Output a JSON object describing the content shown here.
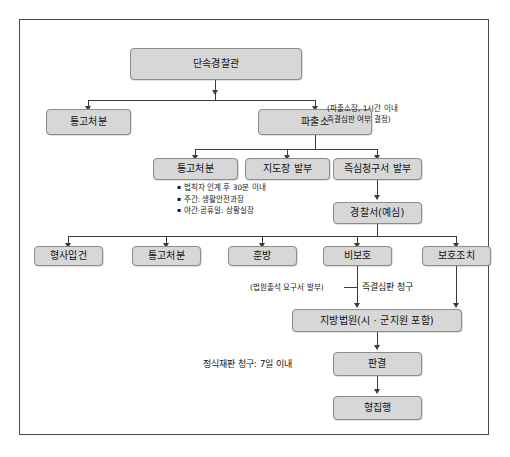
{
  "diagram": {
    "title_visible": false,
    "nodes": [
      {
        "id": "n1",
        "label": "단속경찰관"
      },
      {
        "id": "n2",
        "label": "통고처분"
      },
      {
        "id": "n3",
        "label": "파출소"
      },
      {
        "id": "n4",
        "label": "통고처분"
      },
      {
        "id": "n5",
        "label": "지도장 발부"
      },
      {
        "id": "n6",
        "label": "즉심청구서 발부"
      },
      {
        "id": "n7",
        "label": "경찰서(예심)"
      },
      {
        "id": "n8",
        "label": "형사입건"
      },
      {
        "id": "n9",
        "label": "통고처분"
      },
      {
        "id": "n10",
        "label": "훈방"
      },
      {
        "id": "n11",
        "label": "비보호"
      },
      {
        "id": "n12",
        "label": "보호조치"
      },
      {
        "id": "n13",
        "label": "지방법원(시 · 군지원 포함)"
      },
      {
        "id": "n14",
        "label": "판결"
      },
      {
        "id": "n15",
        "label": "형집행"
      }
    ],
    "notes": {
      "pachulso_note": "(파출소장, 1시간 이내\n즉결심판 여부 결정)",
      "court_request_note": "(법원출석 요구서 발부)"
    },
    "edge_labels": {
      "summary_judgment_request": "즉결심판 청구",
      "formal_trial_request": "정식재판 청구: 7일 이내"
    },
    "bullets": [
      "법칙자 인계 후 30분 이내",
      "주간: 생활안전과장",
      "야간·공휴일: 상황실장"
    ],
    "colors": {
      "node_fill": "#d7d7d7",
      "node_border": "#8c8c8c",
      "connector": "#3c3c3c",
      "frame_border": "#4a4a4a",
      "background": "#ffffff",
      "text": "#141414"
    }
  }
}
